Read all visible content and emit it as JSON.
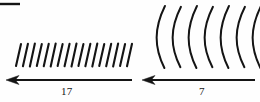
{
  "figure": {
    "title_fragment": "",
    "background_color": "#fefefe",
    "ink_color": "#141414",
    "width": 260,
    "height": 102,
    "top_rule": {
      "name": "top-left-rule",
      "x1": 0,
      "y1": 4,
      "x2": 20,
      "y2": 4,
      "stroke_width": 2.4
    },
    "groups": [
      {
        "id": "left-group",
        "mark_type": "straight-hatch",
        "count": 17,
        "description": "row of short slanted straight strokes leaning right",
        "x_start": 16,
        "x_end": 127,
        "y_top": 44,
        "y_bottom": 66,
        "slant_dx": 5,
        "stroke_width": 2.1,
        "arrow": {
          "name": "left-arrow",
          "direction": "left",
          "x_tail": 132,
          "x_head": 6,
          "y": 80,
          "stroke_width": 2.0,
          "head_width": 13,
          "head_height": 9
        },
        "label": "17"
      },
      {
        "id": "right-group",
        "mark_type": "curved-arc",
        "count": 7,
        "description": "row of tall arcs bowing leftward like parentheses",
        "x_start": 160,
        "x_end": 256,
        "y_top": 6,
        "y_bottom": 68,
        "bow": 11,
        "stroke_width": 2.0,
        "arrow": {
          "name": "right-arrow",
          "direction": "left",
          "x_tail": 255,
          "x_head": 142,
          "y": 80,
          "stroke_width": 2.0,
          "head_width": 13,
          "head_height": 9
        },
        "label": "7"
      }
    ]
  }
}
